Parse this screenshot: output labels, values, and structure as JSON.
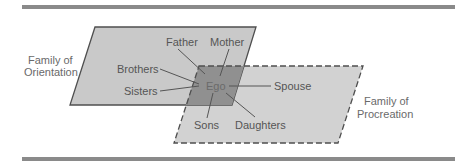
{
  "diagram": {
    "family_orientation": {
      "line1": "Family of",
      "line2": "Orientation"
    },
    "family_procreation": {
      "line1": "Family of",
      "line2": "Procreation"
    },
    "center": "Ego",
    "relatives": {
      "father": "Father",
      "mother": "Mother",
      "brothers": "Brothers",
      "sisters": "Sisters",
      "spouse": "Spouse",
      "sons": "Sons",
      "daughters": "Daughters"
    },
    "colors": {
      "rule": "#8a8a8a",
      "orientation_fill": "#c9c9c9",
      "procreation_fill": "#d2d2d2",
      "overlap_fill": "#909090",
      "outline": "#4f4f4f",
      "text": "#6a6a6a"
    }
  }
}
